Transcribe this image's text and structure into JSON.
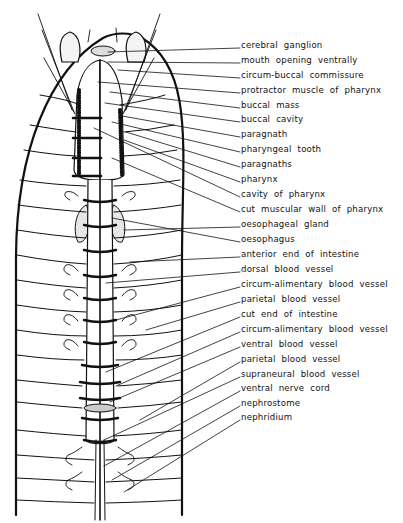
{
  "figure": {
    "labels": [
      {
        "text": "cerebral ganglion",
        "y": 45
      },
      {
        "text": "mouth opening ventrally",
        "y": 60
      },
      {
        "text": "circum-buccal commissure",
        "y": 75
      },
      {
        "text": "protractor muscle of pharynx",
        "y": 90
      },
      {
        "text": "buccal mass",
        "y": 105
      },
      {
        "text": "buccal cavity",
        "y": 119
      },
      {
        "text": "paragnath",
        "y": 134
      },
      {
        "text": "pharyngeal tooth",
        "y": 149
      },
      {
        "text": "paragnaths",
        "y": 164
      },
      {
        "text": "pharynx",
        "y": 179
      },
      {
        "text": "cavity of pharynx",
        "y": 194
      },
      {
        "text": "cut muscular wall of pharynx",
        "y": 209
      },
      {
        "text": "oesophageal gland",
        "y": 224
      },
      {
        "text": "oesophagus",
        "y": 239
      },
      {
        "text": "anterior end of intestine",
        "y": 254
      },
      {
        "text": "dorsal blood vessel",
        "y": 269
      },
      {
        "text": "circum-alimentary blood vessel",
        "y": 284
      },
      {
        "text": "parietal blood vessel",
        "y": 299
      },
      {
        "text": "cut end of intestine",
        "y": 314
      },
      {
        "text": "circum-alimentary blood vessel",
        "y": 329
      },
      {
        "text": "ventral blood vessel",
        "y": 344
      },
      {
        "text": "parietal blood vessel",
        "y": 359
      },
      {
        "text": "supraneural blood vessel",
        "y": 374
      },
      {
        "text": "ventral nerve cord",
        "y": 388
      },
      {
        "text": "nephrostome",
        "y": 403
      },
      {
        "text": "nephridium",
        "y": 417
      }
    ]
  }
}
